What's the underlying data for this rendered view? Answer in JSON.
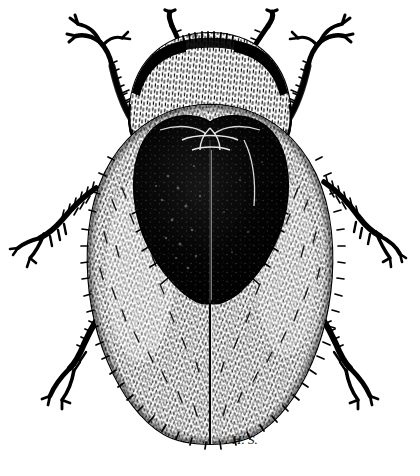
{
  "figure": {
    "kind": "scientific-illustration",
    "technique": "pen-and-ink line engraving",
    "subject_common_name": "beetle",
    "view": "dorsal",
    "background_color": "#ffffff",
    "ink_color": "#000000",
    "canvas": {
      "width": 420,
      "height": 476
    }
  },
  "signature": {
    "monogram": "H. S.",
    "x": 232,
    "y": 444
  },
  "anatomy": {
    "pronotum": {
      "label": "pronotum",
      "description": "broad semicircular shield covering the head, densely pubescent, dark anterior margin",
      "cx": 210,
      "cy": 105,
      "rx": 80,
      "ry": 72,
      "top_band_color": "#000000"
    },
    "elytra": {
      "label": "elytra",
      "description": "large oval wing covers, pale and densely hairy, fringed margin",
      "cx": 210,
      "cy": 265,
      "rx": 122,
      "ry": 160,
      "suture_x": 210
    },
    "dark_marking": {
      "label": "heart-shaped dark macula",
      "description": "large black heart/shield shaped patch spanning both elytra",
      "top_y": 120,
      "apex_y": 303,
      "left_x": 134,
      "right_x": 288
    },
    "antennae": [
      {
        "side": "left",
        "label": "left antenna",
        "base_x": 186,
        "base_y": 55,
        "tip_x": 170,
        "tip_y": 22
      },
      {
        "side": "right",
        "label": "right antenna",
        "base_x": 248,
        "base_y": 55,
        "tip_x": 268,
        "tip_y": 24
      }
    ],
    "legs": [
      {
        "position": "fore",
        "side": "left",
        "label": "left foreleg"
      },
      {
        "position": "fore",
        "side": "right",
        "label": "right foreleg"
      },
      {
        "position": "mid",
        "side": "left",
        "label": "left midleg"
      },
      {
        "position": "mid",
        "side": "right",
        "label": "right midleg"
      },
      {
        "position": "hind",
        "side": "left",
        "label": "left hindleg"
      },
      {
        "position": "hind",
        "side": "right",
        "label": "right hindleg"
      }
    ]
  },
  "counts": {
    "legs": 6,
    "antennae": 2,
    "elytra": 2
  }
}
